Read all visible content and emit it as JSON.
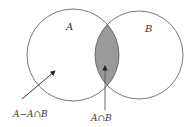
{
  "diagram": {
    "type": "venn",
    "sets": [
      {
        "name": "A",
        "label": "A"
      },
      {
        "name": "B",
        "label": "B"
      }
    ],
    "annotations": [
      {
        "label": "A−A∩B",
        "target": "A only region"
      },
      {
        "label": "A∩B",
        "target": "intersection (shaded)"
      }
    ],
    "colors": {
      "stroke": "#555555",
      "intersection_fill": "#9a9a9a",
      "background": "#ffffff"
    }
  }
}
